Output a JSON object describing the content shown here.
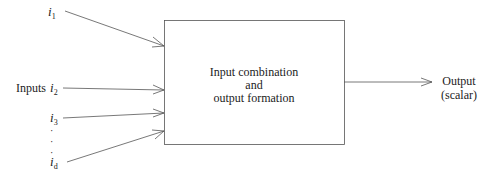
{
  "diagram": {
    "inputs_label": "Inputs",
    "inputs": [
      {
        "name": "i",
        "sub": "1"
      },
      {
        "name": "i",
        "sub": "2"
      },
      {
        "name": "i",
        "sub": "3"
      },
      {
        "name": "i",
        "sub": "d"
      }
    ],
    "ellipsis": [
      "·",
      "·",
      "·"
    ],
    "box": {
      "line1": "Input combination",
      "line2": "and",
      "line3": "output formation"
    },
    "output": {
      "line1": "Output",
      "line2": "(scalar)"
    },
    "colors": {
      "stroke": "#555555",
      "text": "#222222"
    }
  }
}
